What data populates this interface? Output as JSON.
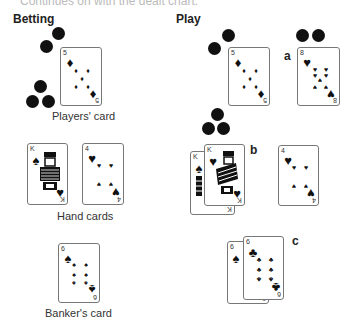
{
  "header": {
    "cut_text": "Continues on with the dealt chart."
  },
  "sections": {
    "betting": {
      "title": "Betting",
      "captions": {
        "players": "Players' card",
        "hand": "Hand cards",
        "banker": "Banker's card"
      },
      "cards": {
        "players": {
          "rank": "5",
          "suit": "diamond"
        },
        "hand_1": {
          "rank": "K",
          "suit": "spade"
        },
        "hand_2": {
          "rank": "4",
          "suit": "heart"
        },
        "banker": {
          "rank": "6",
          "suit": "spade"
        }
      }
    },
    "play": {
      "title": "Play",
      "labels": {
        "a": "a",
        "b": "b",
        "c": "c"
      },
      "cards": {
        "main": {
          "rank": "5",
          "suit": "diamond"
        },
        "a": {
          "rank": "8",
          "suit": "heart"
        },
        "b_back": {
          "rank": "K",
          "suit": "spade"
        },
        "b_front": {
          "rank": "K",
          "suit": "heart"
        },
        "b_side": {
          "rank": "4",
          "suit": "heart"
        },
        "c_back": {
          "rank": "6",
          "suit": "spade"
        },
        "c_front": {
          "rank": "6",
          "suit": "club"
        }
      }
    }
  },
  "glyphs": {
    "diamond": "♦",
    "heart": "♥",
    "spade": "♠",
    "club": "♣"
  },
  "colors": {
    "chip": "#111111",
    "card_border": "#777777"
  }
}
